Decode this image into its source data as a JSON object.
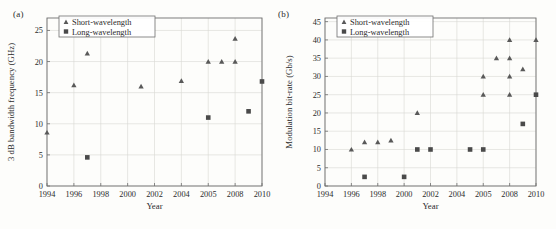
{
  "figure": {
    "background_color": "#fdfdfb",
    "marker_color_short": "#595959",
    "marker_color_long": "#4a4a4a",
    "grid_color": "#d8d8d4",
    "axis_color": "#6f6f6f"
  },
  "panels": [
    {
      "label": "(a)",
      "chart_data": {
        "type": "scatter",
        "title": "",
        "xlabel": "Year",
        "ylabel": "3 dB bandwidth frequency (GHz)",
        "categories": [
          "1994",
          "1996",
          "1998",
          "2000",
          "2002",
          "2004",
          "2005",
          "2008",
          "2010"
        ],
        "xtick_labels": [
          "1994",
          "1996",
          "1998",
          "2000",
          "2002",
          "2004",
          "2005",
          "2008",
          "2010"
        ],
        "ytick_labels": [
          "0",
          "5",
          "10",
          "15",
          "20",
          "25"
        ],
        "ylim": [
          0,
          27
        ],
        "yticks": [
          0,
          5,
          10,
          15,
          20,
          25
        ],
        "grid": true,
        "legend_position": "top-left",
        "series": [
          {
            "name": "Short-wavelength",
            "marker": "triangle",
            "points": [
              {
                "x": 1994,
                "y": 8.6
              },
              {
                "x": 1996,
                "y": 16.2
              },
              {
                "x": 1997,
                "y": 21.3
              },
              {
                "x": 2001,
                "y": 16.0
              },
              {
                "x": 2004,
                "y": 16.9
              },
              {
                "x": 2005,
                "y": 20.0
              },
              {
                "x": 2006.5,
                "y": 20.0
              },
              {
                "x": 2008,
                "y": 20.0
              },
              {
                "x": 2008,
                "y": 23.7
              }
            ]
          },
          {
            "name": "Long-wavelength",
            "marker": "square",
            "points": [
              {
                "x": 1997,
                "y": 4.6
              },
              {
                "x": 2005,
                "y": 11.0
              },
              {
                "x": 2009,
                "y": 12.0
              },
              {
                "x": 2010,
                "y": 16.8
              }
            ]
          }
        ]
      }
    },
    {
      "label": "(b)",
      "chart_data": {
        "type": "scatter",
        "title": "",
        "xlabel": "Year",
        "ylabel": "Modulation bit-rate (Gb/s)",
        "categories": [
          "1994",
          "1996",
          "1998",
          "2000",
          "2002",
          "2004",
          "2005",
          "2008",
          "2010"
        ],
        "xtick_labels": [
          "1994",
          "1996",
          "1998",
          "2000",
          "2002",
          "2004",
          "2005",
          "2008",
          "2010"
        ],
        "ytick_labels": [
          "0",
          "5",
          "10",
          "15",
          "20",
          "25",
          "30",
          "35",
          "40",
          "45"
        ],
        "ylim": [
          0,
          46
        ],
        "yticks": [
          0,
          5,
          10,
          15,
          20,
          25,
          30,
          35,
          40,
          45
        ],
        "grid": true,
        "legend_position": "top-left",
        "series": [
          {
            "name": "Short-wavelength",
            "marker": "triangle",
            "points": [
              {
                "x": 1996,
                "y": 10.0
              },
              {
                "x": 1997,
                "y": 12.0
              },
              {
                "x": 1998,
                "y": 12.0
              },
              {
                "x": 1999,
                "y": 12.5
              },
              {
                "x": 2001,
                "y": 20.0
              },
              {
                "x": 2005,
                "y": 25.0
              },
              {
                "x": 2005,
                "y": 30.0
              },
              {
                "x": 2006.5,
                "y": 35.0
              },
              {
                "x": 2008,
                "y": 25.0
              },
              {
                "x": 2008,
                "y": 30.0
              },
              {
                "x": 2008,
                "y": 35.0
              },
              {
                "x": 2008,
                "y": 40.0
              },
              {
                "x": 2009,
                "y": 32.0
              },
              {
                "x": 2010,
                "y": 40.0
              }
            ]
          },
          {
            "name": "Long-wavelength",
            "marker": "square",
            "points": [
              {
                "x": 1997,
                "y": 2.5
              },
              {
                "x": 2000,
                "y": 2.5
              },
              {
                "x": 2001,
                "y": 10.0
              },
              {
                "x": 2002,
                "y": 10.0
              },
              {
                "x": 2004.5,
                "y": 10.0
              },
              {
                "x": 2005,
                "y": 10.0
              },
              {
                "x": 2009,
                "y": 17.0
              },
              {
                "x": 2010,
                "y": 25.0
              }
            ]
          }
        ]
      }
    }
  ]
}
